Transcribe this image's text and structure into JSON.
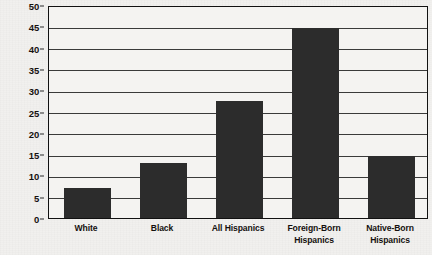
{
  "chart_data": {
    "type": "bar",
    "title": "",
    "subtitle": "",
    "xlabel": "",
    "ylabel": "",
    "categories": [
      "White",
      "Black",
      "All Hispanics",
      "Foreign-Born Hispanics",
      "Native-Born Hispanics"
    ],
    "values": [
      7,
      13,
      27.5,
      44.5,
      14.6
    ],
    "ylim": [
      0,
      50
    ],
    "yticks": [
      0,
      5,
      10,
      15,
      20,
      25,
      30,
      35,
      40,
      45,
      50
    ],
    "ytick_labels": [
      "0",
      "5",
      "10",
      "15",
      "20",
      "25",
      "30",
      "35",
      "40",
      "45",
      "50"
    ],
    "grid": true,
    "legend": false,
    "legend_position": "none",
    "series": [
      {
        "name": "",
        "values": [
          7,
          13,
          27.5,
          44.5,
          14.6
        ]
      }
    ],
    "colors": {
      "bar_fill": "#2c2c2c",
      "plot_border": "#111111",
      "gridline": "#3a3a3a",
      "background": "#f1f0ee",
      "text": "#15110f"
    }
  }
}
